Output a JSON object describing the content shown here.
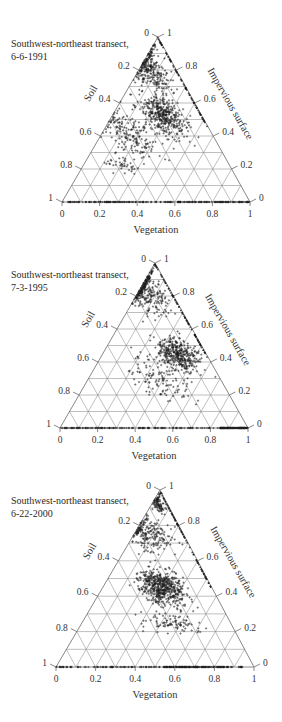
{
  "figure": {
    "panels": [
      {
        "title_line1": "Southwest-northeast transect,",
        "title_line2": "6-6-1991",
        "axes": {
          "bottom": "Vegetation",
          "left": "Soil",
          "right": "Impervious surface"
        }
      },
      {
        "title_line1": "Southwest-northeast transect,",
        "title_line2": "7-3-1995",
        "axes": {
          "bottom": "Vegetation",
          "left": "Soil",
          "right": "Impervious surface"
        }
      },
      {
        "title_line1": "Southwest-northeast transect,",
        "title_line2": "6-22-2000",
        "axes": {
          "bottom": "Vegetation",
          "left": "Soil",
          "right": "Impervious surface"
        }
      }
    ],
    "ticks": {
      "bottom": [
        "0",
        "0.2",
        "0.4",
        "0.6",
        "0.8",
        "1"
      ],
      "left": [
        "0",
        "0.2",
        "0.4",
        "0.6",
        "0.8",
        "1"
      ],
      "right": [
        "1",
        "0.8",
        "0.6",
        "0.4",
        "0.2",
        "0"
      ]
    },
    "colors": {
      "grid": "#8a8a8a",
      "points": "#1f1f1f",
      "text": "#333333"
    }
  },
  "chart_data": [
    {
      "type": "scatter",
      "subtype": "ternary",
      "title": "Southwest-northeast transect, 6-6-1991",
      "axes": [
        "Vegetation",
        "Soil",
        "Impervious surface"
      ],
      "axis_range": [
        0,
        1
      ],
      "tick_step": 0.2,
      "grid": true,
      "grid_step": 0.1,
      "distribution": [
        {
          "region": "near impervious vertex, along soil-impervious edge",
          "impervious": [
            0.6,
            1.0
          ],
          "soil": [
            0.0,
            0.3
          ],
          "density": "high",
          "n": 260
        },
        {
          "region": "central-right cluster",
          "impervious": [
            0.35,
            0.7
          ],
          "soil": [
            0.05,
            0.35
          ],
          "density": "high",
          "n": 380
        },
        {
          "region": "left/middle scatter",
          "impervious": [
            0.2,
            0.6
          ],
          "soil": [
            0.2,
            0.65
          ],
          "density": "medium",
          "n": 180
        },
        {
          "region": "lower-left patch",
          "impervious": [
            0.15,
            0.3
          ],
          "soil": [
            0.45,
            0.7
          ],
          "density": "low",
          "n": 40
        },
        {
          "region": "bottom edge (impervious=0)",
          "impervious": [
            0.0,
            0.0
          ],
          "vegetation": [
            0.0,
            1.0
          ],
          "density": "high",
          "n": 220
        }
      ]
    },
    {
      "type": "scatter",
      "subtype": "ternary",
      "title": "Southwest-northeast transect, 7-3-1995",
      "axes": [
        "Vegetation",
        "Soil",
        "Impervious surface"
      ],
      "axis_range": [
        0,
        1
      ],
      "tick_step": 0.2,
      "grid": true,
      "grid_step": 0.1,
      "distribution": [
        {
          "region": "upper, near impervious vertex / left edge",
          "impervious": [
            0.65,
            1.0
          ],
          "soil": [
            0.0,
            0.3
          ],
          "density": "high",
          "n": 280
        },
        {
          "region": "central-right cluster",
          "impervious": [
            0.3,
            0.6
          ],
          "soil": [
            0.0,
            0.3
          ],
          "density": "high",
          "n": 360
        },
        {
          "region": "sparse middle",
          "impervious": [
            0.1,
            0.5
          ],
          "soil": [
            0.1,
            0.55
          ],
          "density": "low",
          "n": 120
        },
        {
          "region": "bottom edge (impervious=0)",
          "impervious": [
            0.0,
            0.0
          ],
          "vegetation": [
            0.0,
            1.0
          ],
          "density": "high, heaviest near vegetation=0.9-1",
          "n": 260
        }
      ]
    },
    {
      "type": "scatter",
      "subtype": "ternary",
      "title": "Southwest-northeast transect, 6-22-2000",
      "axes": [
        "Vegetation",
        "Soil",
        "Impervious surface"
      ],
      "axis_range": [
        0,
        1
      ],
      "tick_step": 0.2,
      "grid": true,
      "grid_step": 0.1,
      "distribution": [
        {
          "region": "impervious vertex",
          "impervious": [
            0.85,
            1.0
          ],
          "soil": [
            0.0,
            0.1
          ],
          "density": "high",
          "n": 90
        },
        {
          "region": "upper spread",
          "impervious": [
            0.6,
            0.9
          ],
          "soil": [
            0.0,
            0.35
          ],
          "density": "medium",
          "n": 200
        },
        {
          "region": "central cluster",
          "impervious": [
            0.3,
            0.6
          ],
          "soil": [
            0.1,
            0.4
          ],
          "density": "very high",
          "n": 520
        },
        {
          "region": "lower spread",
          "impervious": [
            0.15,
            0.35
          ],
          "soil": [
            0.1,
            0.5
          ],
          "density": "low",
          "n": 90
        },
        {
          "region": "bottom edge (impervious=0)",
          "impervious": [
            0.0,
            0.0
          ],
          "vegetation": [
            0.0,
            0.95
          ],
          "density": "high, heaviest near vegetation=0.6-0.8",
          "n": 240
        }
      ]
    }
  ]
}
